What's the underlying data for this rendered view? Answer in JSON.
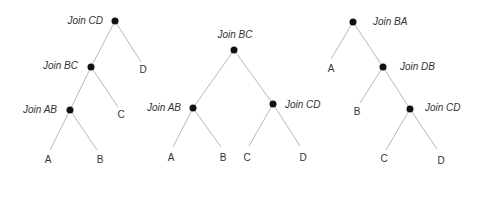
{
  "diagram": {
    "type": "join-trees",
    "trees": [
      {
        "id": "left-deep",
        "joins": [
          {
            "label": "Join CD",
            "x": 115,
            "y": 21,
            "lx": 103,
            "ly": 24,
            "anchor": "end"
          },
          {
            "label": "Join BC",
            "x": 91,
            "y": 67,
            "lx": 78,
            "ly": 69,
            "anchor": "end"
          },
          {
            "label": "Join AB",
            "x": 70,
            "y": 110,
            "lx": 57,
            "ly": 113,
            "anchor": "end"
          }
        ],
        "leaves": [
          {
            "label": "D",
            "x": 143,
            "y": 73
          },
          {
            "label": "C",
            "x": 121,
            "y": 118
          },
          {
            "label": "A",
            "x": 48,
            "y": 163
          },
          {
            "label": "B",
            "x": 100,
            "y": 163
          }
        ],
        "edges": [
          [
            115,
            21,
            91,
            67
          ],
          [
            115,
            21,
            141,
            62
          ],
          [
            91,
            67,
            70,
            110
          ],
          [
            91,
            67,
            118,
            107
          ],
          [
            70,
            110,
            50,
            150
          ],
          [
            70,
            110,
            97,
            150
          ]
        ]
      },
      {
        "id": "bushy",
        "joins": [
          {
            "label": "Join BC",
            "x": 234,
            "y": 50,
            "lx": 235,
            "ly": 38,
            "anchor": "middle"
          },
          {
            "label": "Join AB",
            "x": 193,
            "y": 108,
            "lx": 181,
            "ly": 111,
            "anchor": "end"
          },
          {
            "label": "Join CD",
            "x": 273,
            "y": 104,
            "lx": 285,
            "ly": 108,
            "anchor": "start"
          }
        ],
        "leaves": [
          {
            "label": "A",
            "x": 171,
            "y": 161
          },
          {
            "label": "B",
            "x": 223,
            "y": 161
          },
          {
            "label": "C",
            "x": 247,
            "y": 161
          },
          {
            "label": "D",
            "x": 303,
            "y": 161
          }
        ],
        "edges": [
          [
            234,
            50,
            193,
            108
          ],
          [
            234,
            50,
            273,
            104
          ],
          [
            193,
            108,
            173,
            147
          ],
          [
            193,
            108,
            221,
            147
          ],
          [
            273,
            104,
            249,
            146
          ],
          [
            273,
            104,
            300,
            146
          ]
        ]
      },
      {
        "id": "right-deep",
        "joins": [
          {
            "label": "Join BA",
            "x": 353,
            "y": 22,
            "lx": 373,
            "ly": 25,
            "anchor": "start"
          },
          {
            "label": "Join DB",
            "x": 383,
            "y": 67,
            "lx": 400,
            "ly": 70,
            "anchor": "start"
          },
          {
            "label": "Join CD",
            "x": 410,
            "y": 109,
            "lx": 425,
            "ly": 111,
            "anchor": "start"
          }
        ],
        "leaves": [
          {
            "label": "A",
            "x": 331,
            "y": 72
          },
          {
            "label": "B",
            "x": 357,
            "y": 115
          },
          {
            "label": "C",
            "x": 384,
            "y": 162
          },
          {
            "label": "D",
            "x": 441,
            "y": 164
          }
        ],
        "edges": [
          [
            353,
            22,
            331,
            59
          ],
          [
            353,
            22,
            383,
            67
          ],
          [
            383,
            67,
            360,
            103
          ],
          [
            383,
            67,
            410,
            109
          ],
          [
            410,
            109,
            386,
            150
          ],
          [
            410,
            109,
            437,
            149
          ]
        ]
      }
    ]
  }
}
